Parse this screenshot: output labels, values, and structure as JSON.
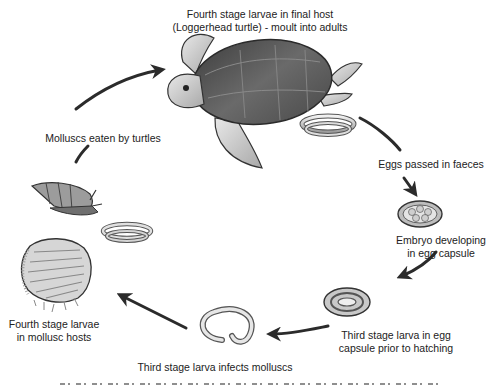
{
  "diagram": {
    "type": "life-cycle",
    "stages": [
      {
        "id": "final-host",
        "label_line1": "Fourth stage larvae in final host",
        "label_line2": "(Loggerhead turtle) - moult into adults"
      },
      {
        "id": "eggs-passed",
        "label_line1": "Eggs passed in faeces"
      },
      {
        "id": "embryo",
        "label_line1": "Embryo developing",
        "label_line2": "in egg capsule"
      },
      {
        "id": "third-stage-egg",
        "label_line1": "Third stage larva in egg",
        "label_line2": "capsule prior to hatching"
      },
      {
        "id": "infects-molluscs",
        "label_line1": "Third stage larva infects molluscs"
      },
      {
        "id": "mollusc-hosts",
        "label_line1": "Fourth stage larvae",
        "label_line2": "in mollusc hosts"
      },
      {
        "id": "eaten",
        "label_line1": "Molluscs eaten by turtles"
      }
    ],
    "colors": {
      "arrow": "#2b2b2b",
      "shell": "#5a5a5a",
      "skin": "#c8c8c8",
      "text": "#222222"
    }
  }
}
